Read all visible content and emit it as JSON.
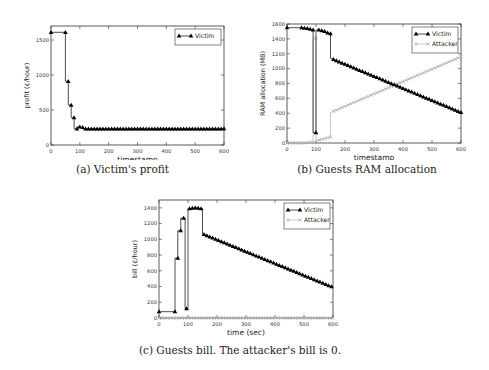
{
  "chart_data": [
    {
      "id": "a",
      "type": "line",
      "title": "",
      "caption": "(a) Victim's profit",
      "xlabel": "timestamp",
      "ylabel": "profit (¢/hour)",
      "xlim": [
        0,
        600
      ],
      "ylim": [
        0,
        1700
      ],
      "xticks": [
        0,
        100,
        200,
        300,
        400,
        500,
        600
      ],
      "yticks": [
        0,
        500,
        1000,
        1500
      ],
      "legend": {
        "position": "upper right",
        "entries": [
          "Victim"
        ]
      },
      "series": [
        {
          "name": "Victim",
          "color": "#000000",
          "marker": "triangle",
          "x": [
            0,
            50,
            50,
            60,
            60,
            70,
            70,
            80,
            80,
            90,
            90,
            100,
            100,
            110,
            110,
            120,
            130,
            140,
            150,
            160,
            170,
            180,
            190,
            200,
            210,
            220,
            230,
            240,
            250,
            260,
            270,
            280,
            290,
            300,
            310,
            320,
            330,
            340,
            350,
            360,
            370,
            380,
            390,
            400,
            410,
            420,
            430,
            440,
            450,
            460,
            470,
            480,
            490,
            500,
            510,
            520,
            530,
            540,
            550,
            560,
            570,
            580,
            590,
            600
          ],
          "y": [
            1610,
            1610,
            910,
            910,
            570,
            570,
            390,
            390,
            230,
            230,
            260,
            260,
            250,
            250,
            230,
            230,
            230,
            230,
            230,
            230,
            230,
            230,
            230,
            230,
            230,
            230,
            230,
            230,
            230,
            230,
            230,
            230,
            230,
            230,
            230,
            230,
            230,
            230,
            230,
            230,
            230,
            230,
            230,
            230,
            230,
            230,
            230,
            230,
            230,
            230,
            230,
            230,
            230,
            230,
            230,
            230,
            230,
            230,
            230,
            230,
            230,
            230,
            230,
            235
          ]
        }
      ]
    },
    {
      "id": "b",
      "type": "line",
      "title": "",
      "caption": "(b) Guests RAM allocation",
      "xlabel": "timestamp",
      "ylabel": "RAM allocation (MB)",
      "xlim": [
        0,
        600
      ],
      "ylim": [
        0,
        1600
      ],
      "xticks": [
        0,
        100,
        200,
        300,
        400,
        500,
        600
      ],
      "yticks": [
        0,
        200,
        400,
        600,
        800,
        1000,
        1200,
        1400,
        1600
      ],
      "legend": {
        "position": "upper right",
        "entries": [
          "Victim",
          "Attacker"
        ]
      },
      "series": [
        {
          "name": "Victim",
          "color": "#000000",
          "marker": "triangle",
          "x": [
            0,
            50,
            60,
            70,
            80,
            90,
            90,
            100,
            100,
            110,
            120,
            130,
            140,
            150,
            150,
            600
          ],
          "y": [
            1550,
            1550,
            1545,
            1540,
            1530,
            1520,
            140,
            140,
            1520,
            1520,
            1510,
            1500,
            1480,
            1470,
            1140,
            410
          ]
        },
        {
          "name": "Attacker",
          "color": "#b0b0b0",
          "marker": "x",
          "x": [
            0,
            50,
            90,
            90,
            100,
            100,
            150,
            150,
            600
          ],
          "y": [
            0,
            0,
            10,
            1410,
            1410,
            30,
            80,
            410,
            1160
          ]
        }
      ]
    },
    {
      "id": "c",
      "type": "line",
      "title": "",
      "caption": "(c) Guests bill. The attacker's bill is 0.",
      "xlabel": "time (sec)",
      "ylabel": "bill (¢/hour)",
      "xlim": [
        0,
        600
      ],
      "ylim": [
        0,
        1500
      ],
      "xticks": [
        0,
        100,
        200,
        300,
        400,
        500,
        600
      ],
      "yticks": [
        0,
        200,
        400,
        600,
        800,
        1000,
        1200,
        1400
      ],
      "legend": {
        "position": "upper right",
        "entries": [
          "Victim",
          "Attacker"
        ]
      },
      "series": [
        {
          "name": "Victim",
          "color": "#000000",
          "marker": "triangle",
          "x": [
            0,
            55,
            55,
            65,
            65,
            75,
            75,
            90,
            90,
            100,
            100,
            110,
            120,
            130,
            140,
            150,
            150,
            600
          ],
          "y": [
            80,
            80,
            760,
            760,
            1110,
            1110,
            1270,
            1270,
            120,
            120,
            1390,
            1390,
            1400,
            1400,
            1390,
            1390,
            1070,
            390
          ]
        },
        {
          "name": "Attacker",
          "color": "#b0b0b0",
          "marker": "x",
          "x": [
            0,
            600
          ],
          "y": [
            0,
            0
          ]
        }
      ]
    }
  ]
}
